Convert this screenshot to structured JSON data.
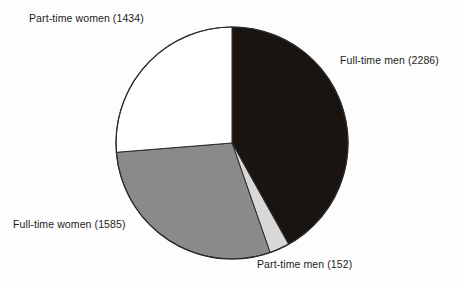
{
  "chart_data": {
    "type": "pie",
    "title": "",
    "subtitle": "",
    "xlabel": "",
    "ylabel": "",
    "legend_position": "none",
    "grid": false,
    "total": 5457,
    "start_angle_deg": 0,
    "direction": "clockwise",
    "categories": [
      "Full-time men",
      "Part-time men",
      "Full-time women",
      "Part-time women"
    ],
    "values": [
      2286,
      152,
      1585,
      1434
    ],
    "slices": [
      {
        "name": "full-time-men",
        "label": "Full-time men (2286)",
        "category": "Full-time men",
        "value": 2286,
        "percent": 41.9,
        "angle_deg": 150.8,
        "color": "#1a1410"
      },
      {
        "name": "part-time-men",
        "label": "Part-time men (152)",
        "category": "Part-time men",
        "value": 152,
        "percent": 2.8,
        "angle_deg": 10.0,
        "color": "#d8d8d8"
      },
      {
        "name": "full-time-women",
        "label": "Full-time women (1585)",
        "category": "Full-time women",
        "value": 1585,
        "percent": 29.0,
        "angle_deg": 104.6,
        "color": "#8a8a8a"
      },
      {
        "name": "part-time-women",
        "label": "Part-time women (1434)",
        "category": "Part-time women",
        "value": 1434,
        "percent": 26.3,
        "angle_deg": 94.6,
        "color": "#ffffff"
      }
    ],
    "colors": {
      "background": "#fdfdfd",
      "outline": "#2b2b2b",
      "text": "#1c1c1c",
      "full_time_men": "#1a1410",
      "part_time_men": "#d8d8d8",
      "full_time_women": "#8a8a8a",
      "part_time_women": "#ffffff"
    },
    "geometry": {
      "center_x": 232,
      "center_y": 143,
      "radius": 116
    }
  },
  "labels": {
    "part_time_women": "Part-time women (1434)",
    "full_time_men": "Full-time men (2286)",
    "full_time_women": "Full-time women (1585)",
    "part_time_men": "Part-time men (152)"
  }
}
